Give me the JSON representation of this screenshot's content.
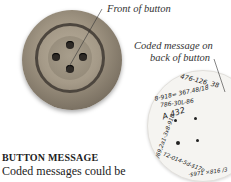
{
  "labels": {
    "front": "Front of button",
    "back_line1": "Coded message on",
    "back_line2": "back of button"
  },
  "coded_message": {
    "ring_outer": "476-126, 389/-8 8-918=367.48/1B=$38 A/0=3048 ,1879 8A47 TLOC",
    "ring_middle": "68-9T8-x-786-30L-8",
    "id": "A 432",
    "snippets": [
      "476-126, 38",
      "8-918= 367.48/18",
      "786-30L-86",
      "A 432"
    ]
  },
  "section": {
    "heading": "BUTTON MESSAGE",
    "body": "Coded messages could be"
  }
}
